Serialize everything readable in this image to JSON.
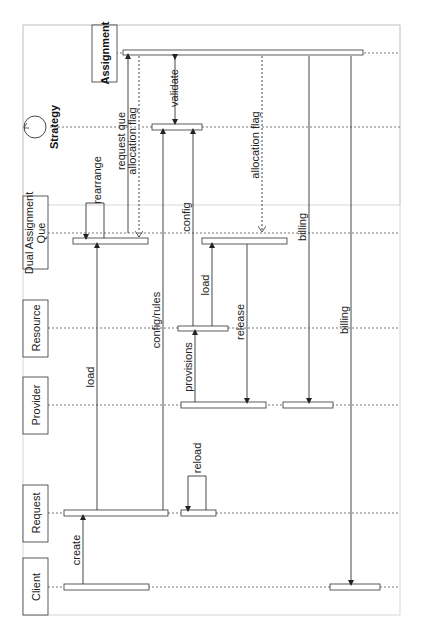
{
  "diagram": {
    "type": "sequence-diagram",
    "orientation": "rotated-90-ccw",
    "participants": [
      {
        "id": "client",
        "label": "Client"
      },
      {
        "id": "request",
        "label": "Request"
      },
      {
        "id": "provider",
        "label": "Provider"
      },
      {
        "id": "resource",
        "label": "Resource"
      },
      {
        "id": "dual_assignment_que",
        "label_line1": "Dual Assignment",
        "label_line2": "Que"
      },
      {
        "id": "strategy",
        "label": "Strategy"
      },
      {
        "id": "assignment",
        "label": "Assignment"
      }
    ],
    "messages": [
      {
        "label": "create",
        "from": "Client",
        "to": "Request"
      },
      {
        "label": "load",
        "from": "Request",
        "to": "Dual Assignment Que"
      },
      {
        "label": "rearrange",
        "from": "Dual Assignment Que",
        "to": "Dual Assignment Que"
      },
      {
        "label": "request que",
        "from": "Dual Assignment Que",
        "to": "Assignment"
      },
      {
        "label": "allocation flag",
        "from": "Assignment",
        "to": "Dual Assignment Que",
        "style": "dashed"
      },
      {
        "label": "config/rules",
        "from": "Request",
        "to": "Strategy"
      },
      {
        "label": "validate",
        "from": "Strategy",
        "to": "Assignment",
        "bidirectional": true
      },
      {
        "label": "reload",
        "from": "Request",
        "to": "Request"
      },
      {
        "label": "provisions",
        "from": "Provider",
        "to": "Resource"
      },
      {
        "label": "config",
        "from": "Resource",
        "to": "Strategy"
      },
      {
        "label": "load",
        "from": "Resource",
        "to": "Dual Assignment Que"
      },
      {
        "label": "allocation flag",
        "from": "Assignment",
        "to": "Dual Assignment Que",
        "style": "dashed"
      },
      {
        "label": "release",
        "from": "Dual Assignment Que",
        "to": "Provider"
      },
      {
        "label": "billing",
        "from": "Assignment",
        "to": "Provider"
      },
      {
        "label": "billing",
        "from": "Assignment",
        "to": "Client"
      }
    ]
  },
  "labels": {
    "client": "Client",
    "request": "Request",
    "provider": "Provider",
    "resource": "Resource",
    "dual1": "Dual Assignment",
    "dual2": "Que",
    "strategy": "Strategy",
    "assignment": "Assignment",
    "create": "create",
    "load1": "load",
    "rearrange": "rearrange",
    "request_que": "request que",
    "allocation_flag1": "allocation flag",
    "config_rules": "config/rules",
    "validate": "validate",
    "reload": "reload",
    "provisions": "provisions",
    "config": "config",
    "load2": "load",
    "allocation_flag2": "allocation flag",
    "release": "release",
    "billing1": "billing",
    "billing2": "billing"
  },
  "colors": {
    "line": "#333333",
    "dotted": "#555555",
    "frame": "#bbbbbb",
    "bar_fill": "#ffffff"
  }
}
